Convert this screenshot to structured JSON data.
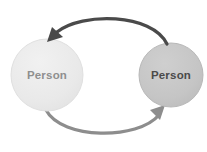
{
  "diagram": {
    "background_color": "#ffffff",
    "nodes": [
      {
        "id": "person-left",
        "label": "Person",
        "cx": 47,
        "cy": 75,
        "r": 36,
        "fill_color": "#e9e9e9",
        "edge_color": "#dcdcdc",
        "text_color": "#8f8f8f"
      },
      {
        "id": "person-right",
        "label": "Person",
        "cx": 171,
        "cy": 75,
        "r": 32,
        "fill_color": "#c5c5c5",
        "edge_color": "#b8b8b8",
        "text_color": "#4a4a4a"
      }
    ],
    "arrows": [
      {
        "id": "arrow-top",
        "direction": "right-to-left",
        "from": "person-right",
        "to": "person-left",
        "color": "#4a4a4a",
        "stroke_width": 3.2,
        "path": "M 166 44 C 150 14, 80 14, 55 34",
        "arrowhead_at": [
          52,
          38
        ]
      },
      {
        "id": "arrow-bottom",
        "direction": "left-to-right",
        "from": "person-left",
        "to": "person-right",
        "color": "#8d8d8d",
        "stroke_width": 3.2,
        "path": "M 46 110 C 62 140, 138 140, 161 114",
        "arrowhead_at": [
          164,
          110
        ]
      }
    ]
  }
}
